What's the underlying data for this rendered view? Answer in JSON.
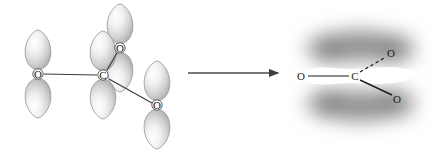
{
  "figure": {
    "background_color": "#ffffff",
    "transition_arrow": {
      "name": "reaction-arrow",
      "direction": "right",
      "x1": 188,
      "y1": 73,
      "x2": 280,
      "y2": 73,
      "color": "#444444"
    },
    "left_structure": {
      "caption": "p-orbital (localized) representation",
      "lobe_fill_light": "#fdfdfd",
      "lobe_fill_mid": "#d8d8d8",
      "lobe_fill_dark": "#a8a8a8",
      "lobe_stroke": "#8d8d8d",
      "bond_color": "#3a3a3a",
      "atoms": [
        {
          "id": "o-left",
          "label": "O",
          "x": 38,
          "y": 74,
          "orbital": "p-vertical"
        },
        {
          "id": "c-center",
          "label": "C",
          "x": 103,
          "y": 75,
          "orbital": "p-vertical"
        },
        {
          "id": "o-top",
          "label": "O",
          "x": 120,
          "y": 48,
          "orbital": "p-vertical"
        },
        {
          "id": "o-bottom",
          "label": "O",
          "x": 157,
          "y": 105,
          "orbital": "p-vertical"
        }
      ],
      "bonds": [
        {
          "id": "bond-o-left-c",
          "from": "o-left",
          "to": "c-center"
        },
        {
          "id": "bond-c-o-top",
          "from": "c-center",
          "to": "o-top"
        },
        {
          "id": "bond-c-o-bottom",
          "from": "c-center",
          "to": "o-bottom"
        }
      ]
    },
    "right_structure": {
      "caption": "delocalized pi electron cloud (resonance hybrid)",
      "cloud_color": "#8a8a8a",
      "bond_color": "#1f1f1f",
      "clouds": [
        {
          "id": "pi-cloud-top",
          "cx": 360,
          "cy": 46,
          "rx": 62,
          "ry": 28
        },
        {
          "id": "pi-cloud-bottom",
          "cx": 360,
          "cy": 104,
          "rx": 62,
          "ry": 28
        }
      ],
      "atoms": [
        {
          "id": "o-left",
          "label": "O",
          "x": 301,
          "y": 76
        },
        {
          "id": "c-center",
          "label": "C",
          "x": 355,
          "y": 76
        },
        {
          "id": "o-upper",
          "label": "O",
          "x": 391,
          "y": 53
        },
        {
          "id": "o-lower",
          "label": "O",
          "x": 397,
          "y": 99
        }
      ],
      "bonds": [
        {
          "id": "bond-o-left-c",
          "from": "o-left",
          "to": "c-center",
          "style": "solid"
        },
        {
          "id": "bond-c-o-upper",
          "from": "c-center",
          "to": "o-upper",
          "style": "dashed"
        },
        {
          "id": "bond-c-o-lower",
          "from": "c-center",
          "to": "o-lower",
          "style": "solid"
        }
      ]
    }
  }
}
